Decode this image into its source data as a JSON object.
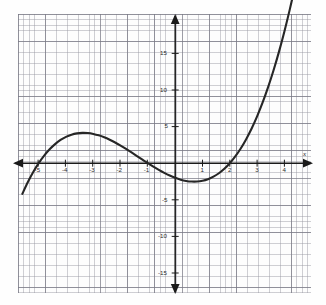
{
  "figure": {
    "kind": "coordinate-grid-plot",
    "background_color": "#fefefe",
    "grid_minor_color": "#9698a0",
    "grid_major_color": "#787884",
    "axis_color": "#1a1a1a",
    "curve_color": "#262626",
    "x_axis_name": "x"
  },
  "chart_data": {
    "type": "line",
    "title": "",
    "subtitle": "",
    "xlabel": "x",
    "ylabel": "",
    "grid": true,
    "legend": null,
    "legend_position": "none",
    "xlim": [
      -5.8,
      4.9
    ],
    "ylim": [
      -17.2,
      18.1
    ],
    "x_tick_labels": [
      "-5",
      "-4",
      "-3",
      "-2",
      "-1",
      "1",
      "2",
      "3",
      "4"
    ],
    "x_ticks": [
      -5,
      -4,
      -3,
      -2,
      -1,
      1,
      2,
      3,
      4
    ],
    "y_tick_labels": [
      "15",
      "10",
      "5",
      "-5",
      "-10",
      "-15"
    ],
    "y_ticks": [
      15,
      10,
      5,
      -5,
      -10,
      -15
    ],
    "minor_grid_step": 0.2,
    "major_grid_step": 1,
    "annotations": {
      "x_intercepts": [
        -5,
        -1,
        2
      ],
      "y_intercept": -2,
      "local_maximum": [
        -3,
        4
      ],
      "local_minimum": [
        1,
        -2.5
      ],
      "equation_fit": "y = 0.2(x + 5)(x + 1)(x - 2)"
    },
    "series": [
      {
        "name": "cubic curve",
        "color": "#262626",
        "x": [
          -5.6,
          -5.4,
          -5.2,
          -5.0,
          -4.8,
          -4.6,
          -4.4,
          -4.2,
          -4.0,
          -3.8,
          -3.6,
          -3.4,
          -3.2,
          -3.0,
          -2.8,
          -2.6,
          -2.4,
          -2.2,
          -2.0,
          -1.8,
          -1.6,
          -1.4,
          -1.2,
          -1.0,
          -0.8,
          -0.6,
          -0.4,
          -0.2,
          0.0,
          0.2,
          0.4,
          0.6,
          0.8,
          1.0,
          1.2,
          1.4,
          1.6,
          1.8,
          2.0,
          2.2,
          2.4,
          2.6,
          2.8,
          3.0,
          3.2,
          3.4,
          3.6,
          3.8,
          4.0,
          4.2,
          4.35
        ],
        "y": [
          -7.89,
          -5.56,
          -3.43,
          -1.5,
          0.23,
          1.78,
          3.14,
          4.32,
          5.32,
          6.16,
          6.82,
          7.33,
          7.68,
          7.88,
          7.94,
          7.86,
          7.64,
          7.3,
          6.84,
          6.26,
          5.57,
          4.78,
          3.89,
          2.9,
          1.83,
          0.68,
          -0.55,
          -1.84,
          -3.2,
          -4.61,
          -6.07,
          -7.56,
          -9.09,
          -10.64,
          -12.2,
          -13.77,
          -15.34,
          -16.91,
          -18.46,
          -19.99,
          -21.49,
          -22.95,
          -24.37,
          -25.74,
          -27.05,
          -28.3,
          -29.47,
          -30.56,
          -31.56,
          -32.47,
          -33.08
        ]
      }
    ]
  },
  "labels": {
    "x_neg": [
      "-5",
      "-4",
      "-3",
      "-2",
      "-1"
    ],
    "x_pos": [
      "1",
      "2",
      "3",
      "4"
    ],
    "y_pos": [
      "15",
      "10",
      "5"
    ],
    "y_neg": [
      "-5",
      "-10",
      "-15"
    ]
  },
  "icons": {
    "x_axis_left_arrow": "arrow-left-icon",
    "x_axis_right_arrow": "arrow-right-icon",
    "y_axis_up_arrow": "arrow-up-icon",
    "y_axis_down_arrow": "arrow-down-icon"
  }
}
